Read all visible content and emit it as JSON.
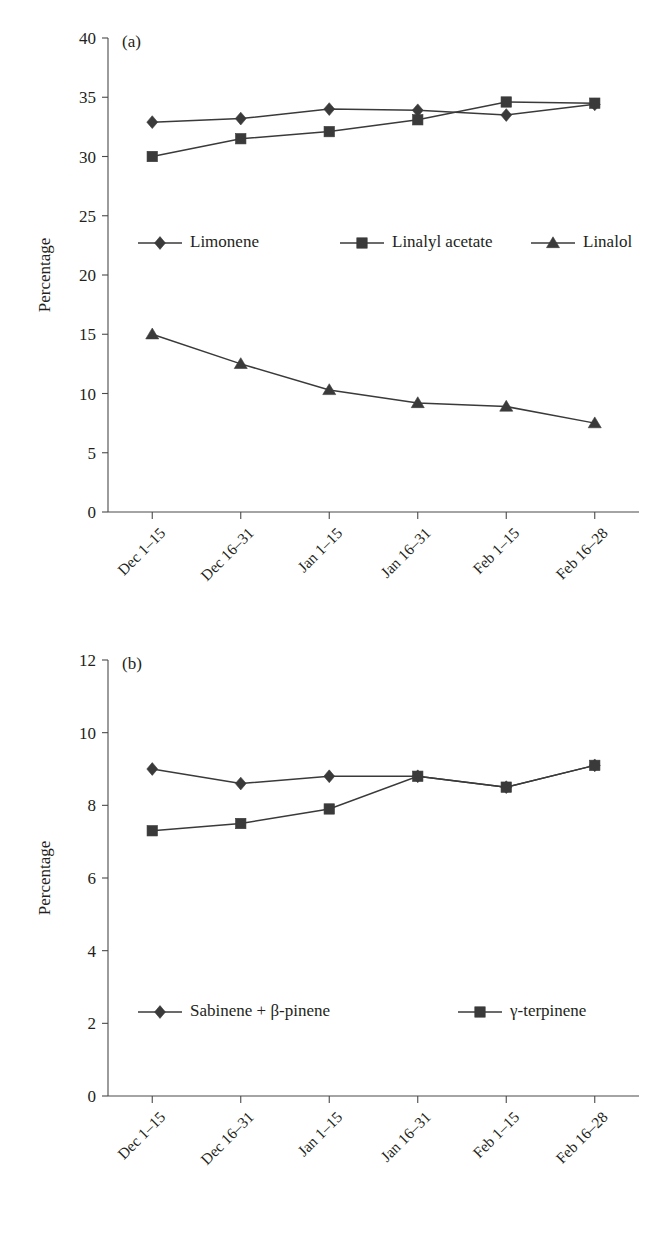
{
  "figure": {
    "panels": [
      {
        "tag": "(a)",
        "ylabel": "Percentage",
        "xlabel": ""
      },
      {
        "tag": "(b)",
        "ylabel": "Percentage",
        "xlabel": ""
      }
    ]
  },
  "chart_data": [
    {
      "type": "line",
      "title": "(a)",
      "xlabel": "",
      "ylabel": "Percentage",
      "ylim": [
        0,
        40
      ],
      "yticks": [
        0,
        5,
        10,
        15,
        20,
        25,
        30,
        35,
        40
      ],
      "ytick_labels": [
        "0",
        "5",
        "10",
        "15",
        "20",
        "25",
        "30",
        "35",
        "40"
      ],
      "grid": false,
      "legend_position": "inside-upper-left",
      "categories": [
        "Dec 1–15",
        "Dec 16–31",
        "Jan 1–15",
        "Jan 16–31",
        "Feb 1–15",
        "Feb 16–28"
      ],
      "series": [
        {
          "name": "Limonene",
          "marker": "diamond",
          "values": [
            32.9,
            33.2,
            34.0,
            33.9,
            33.5,
            34.4
          ]
        },
        {
          "name": "Linalyl acetate",
          "marker": "square",
          "values": [
            30.0,
            31.5,
            32.1,
            33.1,
            34.6,
            34.5
          ]
        },
        {
          "name": "Linalol",
          "marker": "triangle",
          "values": [
            15.0,
            12.5,
            10.3,
            9.2,
            8.9,
            7.5
          ]
        }
      ]
    },
    {
      "type": "line",
      "title": "(b)",
      "xlabel": "",
      "ylabel": "Percentage",
      "ylim": [
        0,
        12
      ],
      "yticks": [
        0,
        2,
        4,
        6,
        8,
        10,
        12
      ],
      "ytick_labels": [
        "0",
        "2",
        "4",
        "6",
        "8",
        "10",
        "12"
      ],
      "grid": false,
      "legend_position": "inside-lower-left",
      "categories": [
        "Dec 1–15",
        "Dec 16–31",
        "Jan 1–15",
        "Jan 16–31",
        "Feb 1–15",
        "Feb 16–28"
      ],
      "series": [
        {
          "name": "Sabinene + β-pinene",
          "marker": "diamond",
          "values": [
            9.0,
            8.6,
            8.8,
            8.8,
            8.5,
            9.1
          ]
        },
        {
          "name": "γ-terpinene",
          "marker": "square",
          "values": [
            7.3,
            7.5,
            7.9,
            8.8,
            8.5,
            9.1
          ]
        }
      ]
    }
  ],
  "colors": {
    "ink": "#231f20",
    "axis": "#4a4a4a",
    "series": "#3a3a3a",
    "background": "#ffffff"
  }
}
